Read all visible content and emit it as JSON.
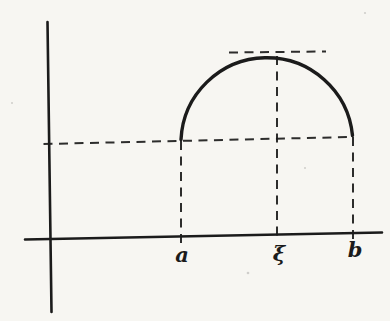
{
  "figure": {
    "type": "math-diagram",
    "labels": {
      "a": "a",
      "xi": "ξ",
      "b": "b"
    }
  },
  "colors": {
    "ink": "#1b1b1b",
    "paper": "#f7f6f2"
  }
}
